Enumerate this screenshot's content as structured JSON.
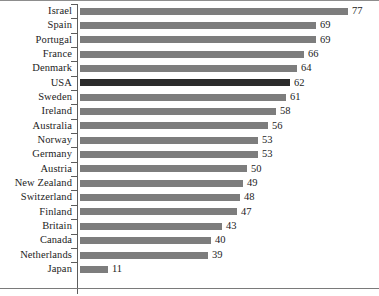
{
  "chart_data": {
    "type": "bar",
    "orientation": "horizontal",
    "title": "",
    "subtitle": "",
    "xlabel": "",
    "ylabel": "",
    "xlim": [
      0,
      80
    ],
    "grid": false,
    "legend": null,
    "highlight_category": "USA",
    "colors": {
      "bar": "#7d7d7d",
      "bar_highlight": "#2b2b2b",
      "axis": "#5c5c5c",
      "text": "#1c1c1c",
      "background": "#ffffff"
    },
    "categories": [
      "Israel",
      "Spain",
      "Portugal",
      "France",
      "Denmark",
      "USA",
      "Sweden",
      "Ireland",
      "Australia",
      "Norway",
      "Germany",
      "Austria",
      "New Zealand",
      "Switzerland",
      "Finland",
      "Britain",
      "Canada",
      "Netherlands",
      "Japan"
    ],
    "values": [
      77,
      69,
      69,
      66,
      64,
      62,
      61,
      58,
      56,
      53,
      53,
      50,
      49,
      48,
      47,
      43,
      40,
      39,
      11
    ],
    "value_labels": [
      "77",
      "69",
      "69",
      "66",
      "64",
      "62",
      "61",
      "58",
      "56",
      "53",
      "53",
      "50",
      "49",
      "48",
      "47",
      "43",
      "40",
      "39",
      "11"
    ],
    "bar_pixel_lengths": [
      268,
      236,
      236,
      224,
      217,
      210,
      206,
      196,
      188,
      178,
      178,
      167,
      163,
      160,
      157,
      142,
      131,
      128,
      28
    ]
  }
}
